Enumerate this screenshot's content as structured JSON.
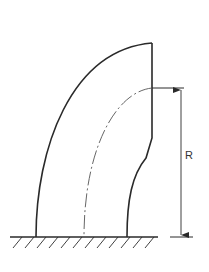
{
  "diagram": {
    "dimension_label": "R",
    "colors": {
      "stroke": "#2a2a2a",
      "centerline": "#555555",
      "background": "#ffffff"
    },
    "elements": [
      {
        "id": "outer-contour",
        "type": "curve",
        "style": "solid"
      },
      {
        "id": "inner-contour",
        "type": "curve",
        "style": "solid"
      },
      {
        "id": "centerline",
        "type": "curve",
        "style": "dash-dot"
      },
      {
        "id": "top-flat-edge",
        "type": "line",
        "style": "solid"
      },
      {
        "id": "ground",
        "type": "line",
        "style": "solid",
        "hatched": true
      },
      {
        "id": "radius-dimension",
        "type": "dimension",
        "label": "R"
      }
    ]
  }
}
